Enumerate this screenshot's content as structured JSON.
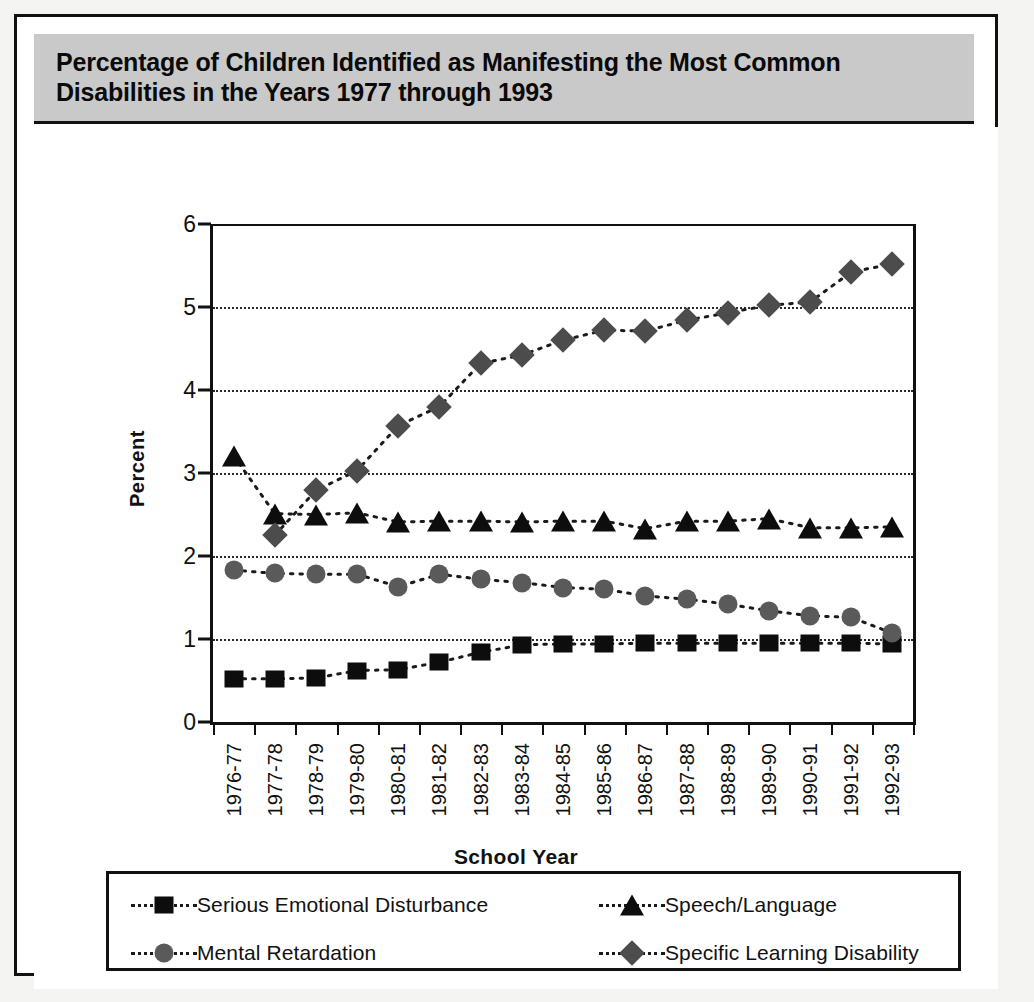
{
  "title": "Percentage of Children Identified as Manifesting the Most Common Disabilities in the Years 1977 through 1993",
  "chart_data": {
    "type": "line",
    "title": "Percentage of Children Identified as Manifesting the Most Common Disabilities in the Years 1977 through 1993",
    "xlabel": "School Year",
    "ylabel": "Percent",
    "ylim": [
      0,
      6
    ],
    "yticks": [
      0,
      1,
      2,
      3,
      4,
      5,
      6
    ],
    "ytick_labels": [
      "0",
      "1",
      "2",
      "3",
      "4",
      "5",
      "6"
    ],
    "grid": "horizontal-dotted",
    "legend_position": "bottom",
    "categories": [
      "1976-77",
      "1977-78",
      "1978-79",
      "1979-80",
      "1980-81",
      "1981-82",
      "1982-83",
      "1983-84",
      "1984-85",
      "1985-86",
      "1986-87",
      "1987-88",
      "1988-89",
      "1989-90",
      "1990-91",
      "1991-92",
      "1992-93"
    ],
    "series": [
      {
        "name": "Serious Emotional Disturbance",
        "marker": "square",
        "color": "#0d0d0d",
        "values": [
          0.52,
          0.52,
          0.53,
          0.62,
          0.63,
          0.72,
          0.84,
          0.93,
          0.94,
          0.94,
          0.95,
          0.95,
          0.95,
          0.95,
          0.95,
          0.95,
          0.94
        ]
      },
      {
        "name": "Speech/Language",
        "marker": "triangle",
        "color": "#0d0d0d",
        "values": [
          3.21,
          2.51,
          2.5,
          2.52,
          2.41,
          2.42,
          2.42,
          2.41,
          2.42,
          2.42,
          2.33,
          2.42,
          2.42,
          2.45,
          2.34,
          2.34,
          2.35
        ]
      },
      {
        "name": "Mental Retardation",
        "marker": "circle",
        "color": "#5a5a5a",
        "values": [
          1.83,
          1.79,
          1.78,
          1.78,
          1.63,
          1.78,
          1.72,
          1.68,
          1.62,
          1.6,
          1.52,
          1.48,
          1.42,
          1.34,
          1.28,
          1.26,
          1.07
        ]
      },
      {
        "name": "Specific Learning Disability",
        "marker": "diamond",
        "color": "#4c4c4c",
        "values": [
          null,
          2.25,
          2.79,
          3.03,
          3.57,
          3.8,
          4.32,
          4.42,
          4.6,
          4.72,
          4.71,
          4.84,
          4.93,
          5.02,
          5.06,
          5.42,
          5.52
        ]
      }
    ]
  },
  "legend": {
    "items": [
      {
        "label": "Serious Emotional Disturbance",
        "marker": "square",
        "color": "#0d0d0d"
      },
      {
        "label": "Speech/Language",
        "marker": "triangle",
        "color": "#0d0d0d"
      },
      {
        "label": "Mental Retardation",
        "marker": "circle",
        "color": "#5a5a5a"
      },
      {
        "label": "Specific Learning Disability",
        "marker": "diamond",
        "color": "#4c4c4c"
      }
    ]
  }
}
